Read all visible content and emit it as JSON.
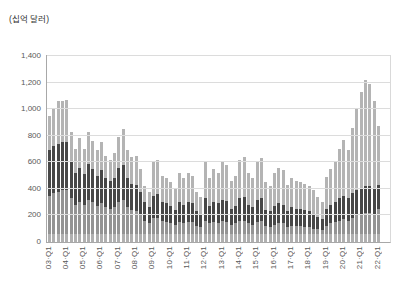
{
  "unit_label": "(십억 달러)",
  "y_axis": {
    "labels": [
      "1,400",
      "1,200",
      "1,000",
      "800",
      "600",
      "400",
      "200",
      "0"
    ],
    "max": 1400,
    "step": 200
  },
  "x_axis": {
    "tick_labels": [
      "03·Q1",
      "04·Q1",
      "05·Q1",
      "06·Q1",
      "07·Q1",
      "08·Q1",
      "09·Q1",
      "10·Q1",
      "11·Q1",
      "12·Q1",
      "13·Q1",
      "14·Q1",
      "15·Q1",
      "16·Q1",
      "17·Q1",
      "18·Q1",
      "19·Q1",
      "20·Q1",
      "21·Q1",
      "22·Q1"
    ],
    "ticks_every_n_bars": 4
  },
  "chart_data": {
    "type": "bar",
    "stacked": true,
    "title": "",
    "xlabel": "",
    "ylabel": "(십억 달러)",
    "ylim": [
      0,
      1400
    ],
    "grid": true,
    "legend": "none",
    "quarters": [
      "03·Q1",
      "03·Q2",
      "03·Q3",
      "03·Q4",
      "04·Q1",
      "04·Q2",
      "04·Q3",
      "04·Q4",
      "05·Q1",
      "05·Q2",
      "05·Q3",
      "05·Q4",
      "06·Q1",
      "06·Q2",
      "06·Q3",
      "06·Q4",
      "07·Q1",
      "07·Q2",
      "07·Q3",
      "07·Q4",
      "08·Q1",
      "08·Q2",
      "08·Q3",
      "08·Q4",
      "09·Q1",
      "09·Q2",
      "09·Q3",
      "09·Q4",
      "10·Q1",
      "10·Q2",
      "10·Q3",
      "10·Q4",
      "11·Q1",
      "11·Q2",
      "11·Q3",
      "11·Q4",
      "12·Q1",
      "12·Q2",
      "12·Q3",
      "12·Q4",
      "13·Q1",
      "13·Q2",
      "13·Q3",
      "13·Q4",
      "14·Q1",
      "14·Q2",
      "14·Q3",
      "14·Q4",
      "15·Q1",
      "15·Q2",
      "15·Q3",
      "15·Q4",
      "16·Q1",
      "16·Q2",
      "16·Q3",
      "16·Q4",
      "17·Q1",
      "17·Q2",
      "17·Q3",
      "17·Q4",
      "18·Q1",
      "18·Q2",
      "18·Q3",
      "18·Q4",
      "19·Q1",
      "19·Q2",
      "19·Q3",
      "19·Q4",
      "20·Q1",
      "20·Q2",
      "20·Q3",
      "20·Q4",
      "21·Q1",
      "21·Q2",
      "21·Q3",
      "21·Q4",
      "22·Q1"
    ],
    "series": [
      {
        "name": "segment-bottom-light",
        "color": "#b0b0b0",
        "values": [
          60,
          60,
          60,
          60,
          60,
          60,
          60,
          60,
          60,
          60,
          60,
          60,
          60,
          60,
          60,
          60,
          60,
          60,
          60,
          60,
          60,
          60,
          60,
          60,
          60,
          60,
          60,
          60,
          60,
          60,
          60,
          60,
          60,
          60,
          60,
          60,
          60,
          60,
          60,
          60,
          60,
          60,
          60,
          60,
          60,
          60,
          60,
          60,
          60,
          60,
          60,
          60,
          60,
          60,
          60,
          60,
          60,
          60,
          60,
          60,
          60,
          60,
          60,
          60,
          60,
          60,
          60,
          60,
          60,
          60,
          60,
          60,
          60,
          60,
          60,
          60,
          60
        ]
      },
      {
        "name": "segment-medium",
        "color": "#949494",
        "values": [
          290,
          310,
          320,
          330,
          330,
          270,
          220,
          240,
          220,
          260,
          240,
          210,
          230,
          200,
          190,
          200,
          240,
          260,
          200,
          180,
          170,
          140,
          100,
          80,
          120,
          120,
          100,
          90,
          80,
          70,
          90,
          80,
          90,
          90,
          60,
          50,
          100,
          80,
          90,
          80,
          100,
          90,
          70,
          80,
          100,
          100,
          80,
          70,
          90,
          100,
          60,
          50,
          70,
          80,
          80,
          50,
          60,
          60,
          60,
          50,
          50,
          40,
          40,
          30,
          60,
          80,
          90,
          100,
          110,
          100,
          120,
          140,
          150,
          160,
          160,
          150,
          190
        ]
      },
      {
        "name": "segment-dark",
        "color": "#474747",
        "values": [
          340,
          350,
          360,
          360,
          360,
          270,
          240,
          260,
          230,
          270,
          250,
          230,
          250,
          220,
          210,
          220,
          260,
          260,
          220,
          200,
          200,
          180,
          140,
          120,
          170,
          180,
          140,
          140,
          130,
          110,
          150,
          140,
          150,
          140,
          110,
          100,
          170,
          130,
          150,
          150,
          160,
          160,
          120,
          130,
          170,
          180,
          140,
          130,
          170,
          170,
          120,
          120,
          140,
          150,
          140,
          120,
          140,
          130,
          130,
          130,
          120,
          110,
          90,
          80,
          130,
          140,
          150,
          170,
          180,
          170,
          190,
          190,
          190,
          200,
          200,
          200,
          180
        ]
      },
      {
        "name": "segment-top-light",
        "color": "#b4b4b4",
        "values": [
          260,
          290,
          320,
          315,
          320,
          230,
          180,
          220,
          190,
          240,
          210,
          190,
          210,
          170,
          160,
          190,
          230,
          270,
          210,
          200,
          220,
          170,
          120,
          120,
          260,
          260,
          200,
          190,
          180,
          160,
          220,
          200,
          220,
          210,
          150,
          130,
          270,
          210,
          250,
          230,
          280,
          270,
          210,
          230,
          290,
          300,
          240,
          220,
          280,
          300,
          210,
          190,
          250,
          270,
          260,
          200,
          220,
          210,
          200,
          200,
          190,
          180,
          150,
          130,
          240,
          270,
          310,
          370,
          420,
          360,
          490,
          620,
          730,
          800,
          770,
          650,
          440
        ]
      }
    ],
    "totals": [
      950,
      1010,
      1060,
      1065,
      1070,
      830,
      700,
      780,
      700,
      830,
      760,
      690,
      750,
      650,
      620,
      670,
      790,
      850,
      690,
      640,
      650,
      550,
      420,
      380,
      610,
      620,
      500,
      480,
      450,
      400,
      520,
      480,
      520,
      500,
      380,
      340,
      600,
      480,
      550,
      520,
      600,
      580,
      460,
      500,
      620,
      640,
      520,
      480,
      600,
      630,
      450,
      420,
      520,
      560,
      540,
      430,
      480,
      460,
      450,
      440,
      420,
      390,
      340,
      300,
      490,
      550,
      610,
      700,
      770,
      690,
      860,
      1010,
      1130,
      1220,
      1190,
      1060,
      870
    ]
  },
  "style": {
    "gridline_color": "#dcdcdc",
    "axis_color": "#a8a8a8",
    "tick_label_color": "#595959"
  }
}
